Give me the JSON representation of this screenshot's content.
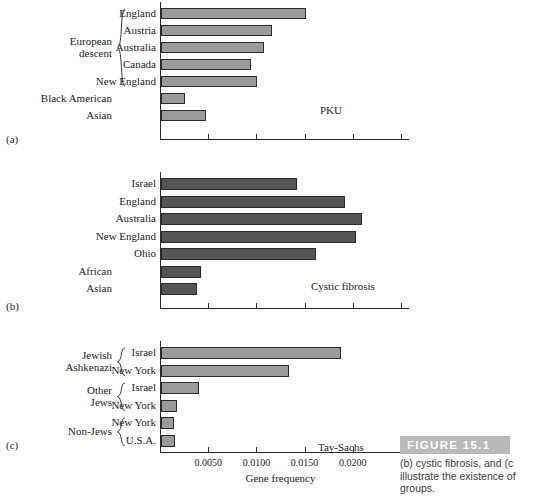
{
  "figure": {
    "badge": "FIGURE 15.1",
    "caption_lines": [
      "(b) cystic fibrosis, and (c",
      "illustrate the existence of",
      "groups."
    ],
    "axis_title": "Gene frequency"
  },
  "panels": [
    {
      "letter": "(a)",
      "annotation": "PKU",
      "group_labels": [
        {
          "text": "European\ndescent",
          "rows": [
            0,
            1,
            2,
            3,
            4
          ]
        },
        {
          "text": "Black American",
          "rows": [
            5
          ]
        },
        {
          "text": "Asian",
          "rows": [
            6
          ]
        }
      ]
    },
    {
      "letter": "(b)",
      "annotation": "Cystic fibrosis",
      "group_labels": [
        {
          "text": "African",
          "rows": [
            5
          ]
        },
        {
          "text": "Asian",
          "rows": [
            6
          ]
        }
      ]
    },
    {
      "letter": "(c)",
      "annotation": "Tay-Sachs",
      "group_labels": [
        {
          "text": "Jewish\nAshkenazi",
          "rows": [
            0,
            1
          ]
        },
        {
          "text": "Other\nJews",
          "rows": [
            2,
            3
          ]
        },
        {
          "text": "Non-Jews",
          "rows": [
            4,
            5
          ]
        }
      ]
    }
  ],
  "chart_data": [
    {
      "type": "bar",
      "orientation": "horizontal",
      "title": "PKU",
      "panel": "(a)",
      "xlabel": "Gene frequency",
      "ylabel": "",
      "xlim": [
        0,
        0.025
      ],
      "xticks": [
        0.005,
        0.01,
        0.015,
        0.02,
        0.025
      ],
      "xticklabels": [
        "",
        "",
        "",
        "",
        ""
      ],
      "grid": false,
      "bar_color": "#9b9b9b",
      "categories": [
        "England",
        "Austria",
        "Australia",
        "Canada",
        "New England",
        "Black American",
        "Asian"
      ],
      "values": [
        0.015,
        0.0115,
        0.0107,
        0.0093,
        0.01,
        0.0025,
        0.0047
      ],
      "row_labels": [
        "England",
        "Austria",
        "Australia",
        "Canada",
        "New England",
        "",
        ""
      ]
    },
    {
      "type": "bar",
      "orientation": "horizontal",
      "title": "Cystic fibrosis",
      "panel": "(b)",
      "xlabel": "Gene frequency",
      "ylabel": "",
      "xlim": [
        0,
        0.025
      ],
      "xticks": [
        0.005,
        0.01,
        0.015,
        0.02,
        0.025
      ],
      "xticklabels": [
        "",
        "",
        "",
        "",
        ""
      ],
      "grid": false,
      "bar_color": "#555555",
      "categories": [
        "Israel",
        "England",
        "Australia",
        "New England",
        "Ohio",
        "African",
        "Asian"
      ],
      "values": [
        0.0141,
        0.0191,
        0.0209,
        0.0202,
        0.0161,
        0.0041,
        0.0037
      ],
      "row_labels": [
        "Israel",
        "England",
        "Australia",
        "New England",
        "Ohio",
        "",
        ""
      ]
    },
    {
      "type": "bar",
      "orientation": "horizontal",
      "title": "Tay-Sachs",
      "panel": "(c)",
      "xlabel": "Gene frequency",
      "ylabel": "",
      "xlim": [
        0,
        0.025
      ],
      "xticks": [
        0.005,
        0.01,
        0.015,
        0.02,
        0.025
      ],
      "xticklabels": [
        "0.0050",
        "0.0100",
        "0.0150",
        "0.0200",
        ""
      ],
      "grid": false,
      "bar_color": "#9b9b9b",
      "categories": [
        "Israel",
        "New York",
        "Israel",
        "New York",
        "New York",
        "U.S.A."
      ],
      "values": [
        0.0187,
        0.0133,
        0.0039,
        0.0017,
        0.0014,
        0.0015
      ],
      "row_labels": [
        "Israel",
        "New York",
        "Israel",
        "New York",
        "New York",
        "U.S.A."
      ]
    }
  ]
}
